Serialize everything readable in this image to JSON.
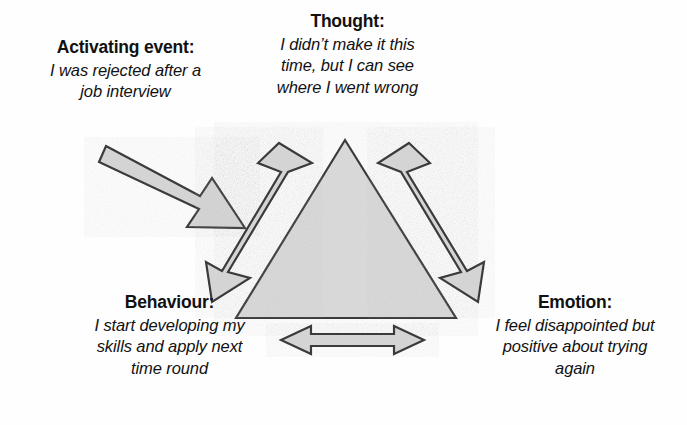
{
  "diagram": {
    "type": "cbt-triangle",
    "colors": {
      "background": "#fefefe",
      "shape_fill": "#d8d8d8",
      "shape_stroke": "#3a3a3a",
      "arrow_fill": "#d4d4d4",
      "arrow_stroke": "#3a3a3a",
      "text": "#111111"
    },
    "nodes": {
      "thought": {
        "title": "Thought:",
        "lines": [
          "I didn’t make it this",
          "time, but I can see",
          "where I went wrong"
        ]
      },
      "activating_event": {
        "title": "Activating event:",
        "lines": [
          "I was rejected after a",
          "job interview"
        ]
      },
      "behaviour": {
        "title": "Behaviour:",
        "lines": [
          "I start developing my",
          "skills and apply next",
          "time round"
        ]
      },
      "emotion": {
        "title": "Emotion:",
        "lines": [
          "I feel disappointed but",
          "positive about trying",
          "again"
        ]
      }
    },
    "connectors": [
      {
        "name": "activating-event-to-triangle-arrow",
        "heads": "single",
        "from": "activating_event",
        "to": "triangle"
      },
      {
        "name": "thought-behaviour-arrow",
        "heads": "double",
        "from": "thought",
        "to": "behaviour"
      },
      {
        "name": "thought-emotion-arrow",
        "heads": "double",
        "from": "thought",
        "to": "emotion"
      },
      {
        "name": "behaviour-emotion-arrow",
        "heads": "double",
        "from": "behaviour",
        "to": "emotion"
      }
    ]
  }
}
